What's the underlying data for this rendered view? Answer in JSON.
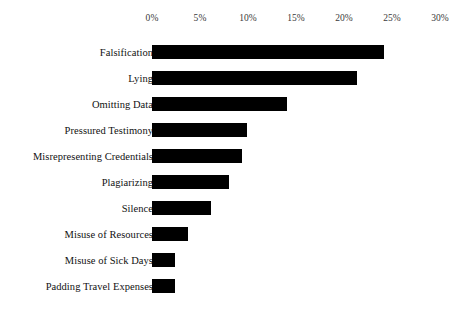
{
  "chart_data": {
    "type": "bar",
    "orientation": "horizontal",
    "title": "",
    "subtitle": "",
    "xlabel": "",
    "ylabel": "",
    "xlim": [
      0,
      30
    ],
    "xtick_labels": [
      "0%",
      "5%",
      "10%",
      "15%",
      "20%",
      "25%",
      "30%"
    ],
    "xticks": [
      0,
      5,
      10,
      15,
      20,
      25,
      30
    ],
    "grid": false,
    "legend": false,
    "bar_color": "#000000",
    "categories": [
      "Falsification",
      "Lying",
      "Omitting Data",
      "Pressured Testimony",
      "Misrepresenting Credentials",
      "Plagiarizing",
      "Silence",
      "Misuse of Resources",
      "Misuse of Sick Days",
      "Padding Travel Expenses"
    ],
    "values": [
      24.2,
      21.4,
      14.1,
      9.9,
      9.4,
      8.0,
      6.1,
      3.8,
      2.4,
      2.4
    ],
    "value_unit": "%"
  },
  "axis": {
    "ticks": [
      {
        "label": "0%",
        "value": 0
      },
      {
        "label": "5%",
        "value": 5
      },
      {
        "label": "10%",
        "value": 10
      },
      {
        "label": "15%",
        "value": 15
      },
      {
        "label": "20%",
        "value": 20
      },
      {
        "label": "25%",
        "value": 25
      },
      {
        "label": "30%",
        "value": 30
      }
    ]
  },
  "bars": [
    {
      "label": "Falsification",
      "value": 24.2
    },
    {
      "label": "Lying",
      "value": 21.4
    },
    {
      "label": "Omitting Data",
      "value": 14.1
    },
    {
      "label": "Pressured Testimony",
      "value": 9.9
    },
    {
      "label": "Misrepresenting Credentials",
      "value": 9.4
    },
    {
      "label": "Plagiarizing",
      "value": 8.0
    },
    {
      "label": "Silence",
      "value": 6.1
    },
    {
      "label": "Misuse of Resources",
      "value": 3.8
    },
    {
      "label": "Misuse of Sick Days",
      "value": 2.4
    },
    {
      "label": "Padding Travel Expenses",
      "value": 2.4
    }
  ]
}
